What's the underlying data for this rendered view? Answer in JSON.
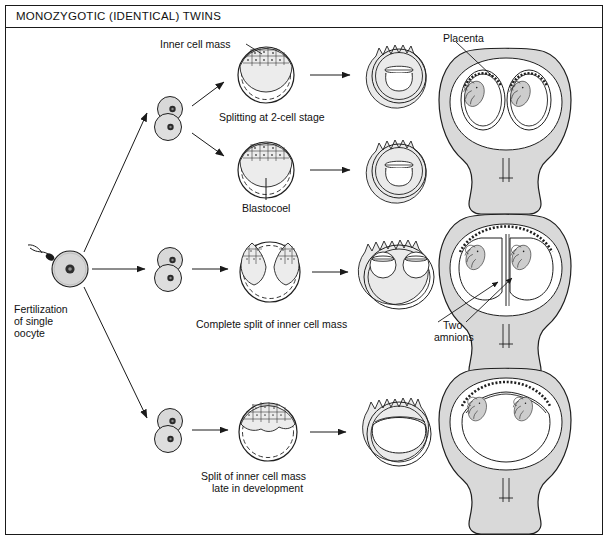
{
  "document": {
    "title": "MONOZYGOTIC (IDENTICAL) TWINS",
    "kind": "medical-illustration",
    "subject": "Mechanisms of monozygotic twinning by timing of embryonic splitting"
  },
  "labels": {
    "inner_cell_mass": "Inner cell mass",
    "splitting_two_cell": "Splitting at 2-cell stage",
    "blastocoel": "Blastocoel",
    "placenta": "Placenta",
    "fertilization": "Fertilization\nof single\noocyte",
    "fertilization_l1": "Fertilization",
    "fertilization_l2": "of single",
    "fertilization_l3": "oocyte",
    "complete_split": "Complete split of inner cell mass",
    "two_amnions_l1": "Two",
    "two_amnions_l2": "amnions",
    "late_split_l1": "Split of inner cell mass",
    "late_split_l2": "late in development"
  },
  "colors": {
    "ink": "#1a1a1a",
    "line": "#222222",
    "cell_fill": "#d8d8d8",
    "cell_fill_light": "#e8e8e8",
    "nucleus": "#2b2b2b",
    "uterus_fill": "#d9d9d9",
    "uterus_inner": "#ffffff",
    "fetus_fill": "#cfcfcf",
    "icm_fill": "#ededed",
    "arrow_fill": "#e6e6e6",
    "background": "#ffffff",
    "frame": "#1a1a1a"
  },
  "rows": [
    {
      "id": "row-top",
      "mechanism": "Splitting at 2-cell stage",
      "outcome": "Dichorionic diamniotic — two separate placentas and sacs",
      "stages": [
        "2-cell embryo",
        "two blastocysts",
        "two chorionic sacs",
        "uterus with two fetuses"
      ]
    },
    {
      "id": "row-middle",
      "mechanism": "Complete split of inner cell mass",
      "outcome": "Monochorionic diamniotic — shared placenta, two amnions",
      "stages": [
        "2-cell embryo",
        "blastocyst with split ICM",
        "one chorion two amnions",
        "uterus with two fetuses"
      ]
    },
    {
      "id": "row-bottom",
      "mechanism": "Split of inner cell mass late in development",
      "outcome": "Monochorionic monoamniotic — shared placenta and single amnion",
      "stages": [
        "2-cell embryo",
        "blastocyst late split",
        "single shared amnion",
        "uterus with two fetuses"
      ]
    }
  ]
}
